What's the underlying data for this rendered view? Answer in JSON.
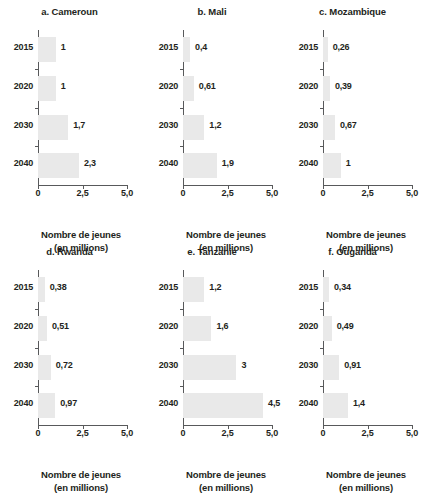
{
  "figure": {
    "axis_title_line1": "Nombre de jeunes",
    "axis_title_line2": "(en millions)",
    "x_ticks": [
      "0",
      "2,5",
      "5,0"
    ],
    "x_tick_values": [
      0,
      2.5,
      5.0
    ],
    "categories": [
      "2015",
      "2020",
      "2030",
      "2040"
    ]
  },
  "chart_data": [
    {
      "type": "bar",
      "title": "a. Cameroun",
      "orientation": "horizontal",
      "categories": [
        "2015",
        "2020",
        "2030",
        "2040"
      ],
      "values": [
        1,
        1,
        1.7,
        2.3
      ],
      "labels": [
        "1",
        "1",
        "1,7",
        "2,3"
      ],
      "xlabel": "Nombre de jeunes (en millions)",
      "ylabel": "",
      "xlim": [
        0,
        5
      ],
      "xticks": [
        "0",
        "2,5",
        "5,0"
      ],
      "grid": false,
      "legend": "none"
    },
    {
      "type": "bar",
      "title": "b. Mali",
      "orientation": "horizontal",
      "categories": [
        "2015",
        "2020",
        "2030",
        "2040"
      ],
      "values": [
        0.4,
        0.61,
        1.2,
        1.9
      ],
      "labels": [
        "0,4",
        "0,61",
        "1,2",
        "1,9"
      ],
      "xlabel": "Nombre de jeunes (en millions)",
      "ylabel": "",
      "xlim": [
        0,
        5
      ],
      "xticks": [
        "0",
        "2,5",
        "5,0"
      ],
      "grid": false,
      "legend": "none"
    },
    {
      "type": "bar",
      "title": "c. Mozambique",
      "orientation": "horizontal",
      "categories": [
        "2015",
        "2020",
        "2030",
        "2040"
      ],
      "values": [
        0.26,
        0.39,
        0.67,
        1
      ],
      "labels": [
        "0,26",
        "0,39",
        "0,67",
        "1"
      ],
      "xlabel": "Nombre de jeunes (en millions)",
      "ylabel": "",
      "xlim": [
        0,
        5
      ],
      "xticks": [
        "0",
        "2,5",
        "5,0"
      ],
      "grid": false,
      "legend": "none"
    },
    {
      "type": "bar",
      "title": "d. Rwanda",
      "orientation": "horizontal",
      "categories": [
        "2015",
        "2020",
        "2030",
        "2040"
      ],
      "values": [
        0.38,
        0.51,
        0.72,
        0.97
      ],
      "labels": [
        "0,38",
        "0,51",
        "0,72",
        "0,97"
      ],
      "xlabel": "Nombre de jeunes (en millions)",
      "ylabel": "",
      "xlim": [
        0,
        5
      ],
      "xticks": [
        "0",
        "2,5",
        "5,0"
      ],
      "grid": false,
      "legend": "none"
    },
    {
      "type": "bar",
      "title": "e. Tanzanie",
      "orientation": "horizontal",
      "categories": [
        "2015",
        "2020",
        "2030",
        "2040"
      ],
      "values": [
        1.2,
        1.6,
        3,
        4.5
      ],
      "labels": [
        "1,2",
        "1,6",
        "3",
        "4,5"
      ],
      "xlabel": "Nombre de jeunes (en millions)",
      "ylabel": "",
      "xlim": [
        0,
        5
      ],
      "xticks": [
        "0",
        "2,5",
        "5,0"
      ],
      "grid": false,
      "legend": "none"
    },
    {
      "type": "bar",
      "title": "f. Ouganda",
      "orientation": "horizontal",
      "categories": [
        "2015",
        "2020",
        "2030",
        "2040"
      ],
      "values": [
        0.34,
        0.49,
        0.91,
        1.4
      ],
      "labels": [
        "0,34",
        "0,49",
        "0,91",
        "1,4"
      ],
      "xlabel": "Nombre de jeunes (en millions)",
      "ylabel": "",
      "xlim": [
        0,
        5
      ],
      "xticks": [
        "0",
        "2,5",
        "5,0"
      ],
      "grid": false,
      "legend": "none"
    }
  ],
  "style": {
    "bar_color": "#e9e9e9",
    "axis_color": "#58595b",
    "text_color": "#231f20",
    "background": "#ffffff"
  }
}
